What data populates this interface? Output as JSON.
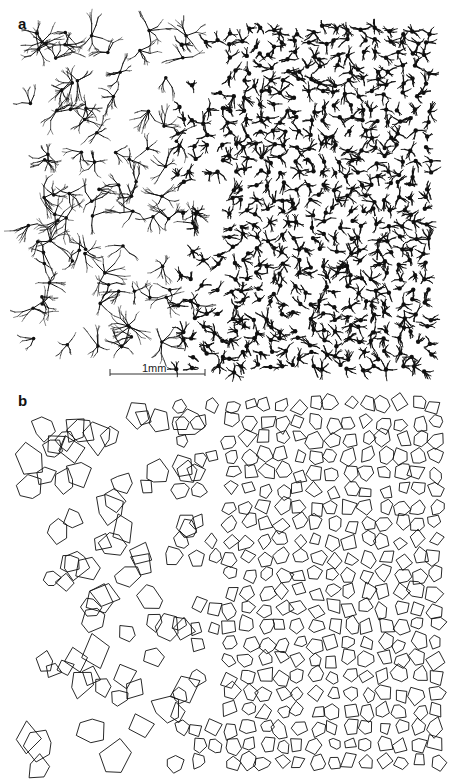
{
  "figure": {
    "panels": [
      {
        "label": "a",
        "content": "dendritic cell drawings, sparse large cells on left, dense small cells on right"
      },
      {
        "label": "b",
        "content": "polygon outlines of cell territories, large on left, dense small on right"
      }
    ],
    "scale_bar": {
      "label": "1mm"
    },
    "colors": {
      "ink": "#111111",
      "background": "#ffffff"
    }
  }
}
